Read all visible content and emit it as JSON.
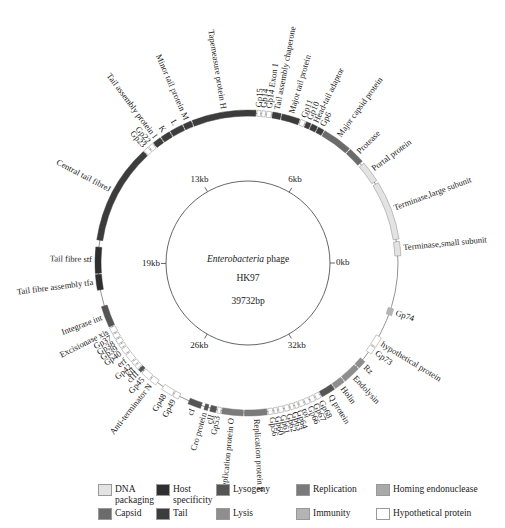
{
  "center": {
    "line1_italic": "Enterobacteria",
    "line1_rest": " phage",
    "line2": "HK97",
    "line3": "39732bp"
  },
  "genome_length_kb": 39.732,
  "ticks": [
    {
      "label": "0kb",
      "kb": 0
    },
    {
      "label": "6kb",
      "kb": 6.6
    },
    {
      "label": "13kb",
      "kb": 13.2
    },
    {
      "label": "19kb",
      "kb": 19.9
    },
    {
      "label": "26kb",
      "kb": 26.5
    },
    {
      "label": "32kb",
      "kb": 33.1
    }
  ],
  "categories": {
    "dna_packaging": {
      "label": "DNA packaging",
      "color": "#e3e3e3"
    },
    "host_specificity": {
      "label": "Host specificity",
      "color": "#2f2f2f"
    },
    "lysogeny": {
      "label": "Lysogeny",
      "color": "#555555"
    },
    "replication": {
      "label": "Replication",
      "color": "#7a7a7a"
    },
    "homing_endonuclease": {
      "label": "Homing endonuclease",
      "color": "#a9a9a9"
    },
    "capsid": {
      "label": "Capsid",
      "color": "#6b6b6b"
    },
    "tail": {
      "label": "Tail",
      "color": "#3c3c3c"
    },
    "lysis": {
      "label": "Lysis",
      "color": "#8e8e8e"
    },
    "immunity": {
      "label": "Immunity",
      "color": "#b4b4b4"
    },
    "hypothetical": {
      "label": "Hypothetical protein",
      "color": "#ffffff"
    }
  },
  "legend": [
    {
      "key": "dna_packaging",
      "label_lines": [
        "DNA",
        "packaging"
      ]
    },
    {
      "key": "host_specificity",
      "label_lines": [
        "Host",
        "specificity"
      ]
    },
    {
      "key": "lysogeny",
      "label_lines": [
        "Lysogeny"
      ]
    },
    {
      "key": "replication",
      "label_lines": [
        "Replication"
      ]
    },
    {
      "key": "homing_endonuclease",
      "label_lines": [
        "Homing endonuclease"
      ]
    },
    {
      "key": "capsid",
      "label_lines": [
        "Capsid"
      ]
    },
    {
      "key": "tail",
      "label_lines": [
        "Tail"
      ]
    },
    {
      "key": "lysis",
      "label_lines": [
        "Lysis"
      ]
    },
    {
      "key": "immunity",
      "label_lines": [
        "Immunity"
      ]
    },
    {
      "key": "hypothetical",
      "label_lines": [
        "Hypothetical protein"
      ]
    }
  ],
  "genes": [
    {
      "name": "Terminase,small subunit",
      "start": 0.3,
      "end": 0.9,
      "cat": "dna_packaging"
    },
    {
      "name": "Terminase,large subunit",
      "start": 1.0,
      "end": 3.5,
      "cat": "dna_packaging"
    },
    {
      "name": "Portal protein",
      "start": 3.6,
      "end": 4.5,
      "cat": "dna_packaging"
    },
    {
      "name": "Protease",
      "start": 4.6,
      "end": 5.3,
      "cat": "capsid"
    },
    {
      "name": "Major capsid protein",
      "start": 5.35,
      "end": 6.6,
      "cat": "capsid"
    },
    {
      "name": "Gp6",
      "start": 6.65,
      "end": 6.9,
      "cat": "tail"
    },
    {
      "name": "Head-tail adaptor",
      "start": 6.95,
      "end": 7.2,
      "cat": "tail"
    },
    {
      "name": "Gp10",
      "start": 7.25,
      "end": 7.45,
      "cat": "tail"
    },
    {
      "name": "Gp11",
      "start": 7.5,
      "end": 7.7,
      "cat": "hypothetical"
    },
    {
      "name": "Major tail protein",
      "start": 7.75,
      "end": 8.5,
      "cat": "tail"
    },
    {
      "name": "Tail assembly chaperone",
      "start": 8.55,
      "end": 8.9,
      "cat": "tail"
    },
    {
      "name": "Gp14 Exon 1",
      "start": 8.95,
      "end": 9.15,
      "cat": "hypothetical"
    },
    {
      "name": "Gp14",
      "start": 9.2,
      "end": 9.35,
      "cat": "hypothetical"
    },
    {
      "name": "Gp15",
      "start": 9.4,
      "end": 9.55,
      "cat": "hypothetical"
    },
    {
      "name": "Tapemeasure protein H",
      "start": 9.6,
      "end": 12.3,
      "cat": "tail"
    },
    {
      "name": "Minor tail protein M",
      "start": 12.35,
      "end": 12.7,
      "cat": "tail"
    },
    {
      "name": "L",
      "start": 12.75,
      "end": 13.3,
      "cat": "tail"
    },
    {
      "name": "K",
      "start": 13.35,
      "end": 13.75,
      "cat": "tail"
    },
    {
      "name": "Tail assembly protein I",
      "start": 13.8,
      "end": 14.15,
      "cat": "tail"
    },
    {
      "name": "Gp22",
      "start": 14.2,
      "end": 14.4,
      "cat": "hypothetical"
    },
    {
      "name": "Gp23",
      "start": 14.45,
      "end": 14.65,
      "cat": "hypothetical"
    },
    {
      "name": "Central tail fibreJ",
      "start": 14.7,
      "end": 18.9,
      "cat": "tail"
    },
    {
      "name": "Tail fibre stf",
      "start": 19.2,
      "end": 20.3,
      "cat": "host_specificity"
    },
    {
      "name": "Tail fibre assembly tfa",
      "start": 20.35,
      "end": 21.0,
      "cat": "host_specificity"
    },
    {
      "name": "Integrase int",
      "start": 21.7,
      "end": 22.6,
      "cat": "lysogeny"
    },
    {
      "name": "Excisionase xis",
      "start": 22.65,
      "end": 22.9,
      "cat": "hypothetical"
    },
    {
      "name": "Gp37",
      "start": 22.95,
      "end": 23.15,
      "cat": "hypothetical"
    },
    {
      "name": "Gp38",
      "start": 23.2,
      "end": 23.4,
      "cat": "hypothetical"
    },
    {
      "name": "Gp39",
      "start": 23.45,
      "end": 23.6,
      "cat": "hypothetical"
    },
    {
      "name": "Gp40",
      "start": 23.65,
      "end": 23.9,
      "cat": "hypothetical"
    },
    {
      "name": "erf",
      "start": 23.95,
      "end": 24.3,
      "cat": "hypothetical"
    },
    {
      "name": "Gp42",
      "start": 24.35,
      "end": 24.5,
      "cat": "hypothetical"
    },
    {
      "name": "kil",
      "start": 24.55,
      "end": 24.7,
      "cat": "hypothetical"
    },
    {
      "name": "cIII",
      "start": 24.75,
      "end": 24.9,
      "cat": "lysogeny"
    },
    {
      "name": "Gp45",
      "start": 24.95,
      "end": 25.35,
      "cat": "hypothetical"
    },
    {
      "name": "Anti-terminator N",
      "start": 25.4,
      "end": 25.7,
      "cat": "hypothetical"
    },
    {
      "name": "Gp48",
      "start": 26.0,
      "end": 26.5,
      "cat": "hypothetical"
    },
    {
      "name": "Gp49",
      "start": 26.55,
      "end": 26.8,
      "cat": "hypothetical"
    },
    {
      "name": "cI",
      "start": 27.25,
      "end": 27.8,
      "cat": "lysogeny"
    },
    {
      "name": "Cro protein",
      "start": 27.95,
      "end": 28.1,
      "cat": "lysogeny"
    },
    {
      "name": "cII",
      "start": 28.2,
      "end": 28.45,
      "cat": "lysogeny"
    },
    {
      "name": "Gp53",
      "start": 28.5,
      "end": 28.65,
      "cat": "hypothetical"
    },
    {
      "name": "Replication protein O",
      "start": 28.7,
      "end": 29.6,
      "cat": "replication"
    },
    {
      "name": "Replication protein P",
      "start": 29.65,
      "end": 30.6,
      "cat": "replication"
    },
    {
      "name": "Gp56",
      "start": 30.65,
      "end": 30.85,
      "cat": "hypothetical"
    },
    {
      "name": "Gp60",
      "start": 30.9,
      "end": 31.05,
      "cat": "hypothetical"
    },
    {
      "name": "Gp61",
      "start": 31.1,
      "end": 31.3,
      "cat": "hypothetical"
    },
    {
      "name": "Gp62",
      "start": 31.35,
      "end": 31.55,
      "cat": "hypothetical"
    },
    {
      "name": "Gp63",
      "start": 31.6,
      "end": 31.75,
      "cat": "hypothetical"
    },
    {
      "name": "Gp64",
      "start": 31.8,
      "end": 31.95,
      "cat": "hypothetical"
    },
    {
      "name": "roi",
      "start": 32.0,
      "end": 32.2,
      "cat": "hypothetical"
    },
    {
      "name": "Gp66",
      "start": 32.25,
      "end": 32.45,
      "cat": "hypothetical"
    },
    {
      "name": "Gp67",
      "start": 32.5,
      "end": 32.7,
      "cat": "hypothetical"
    },
    {
      "name": "Gp68",
      "start": 32.75,
      "end": 32.95,
      "cat": "hypothetical"
    },
    {
      "name": "Q protein",
      "start": 33.0,
      "end": 33.6,
      "cat": "lysogeny"
    },
    {
      "name": "Holin",
      "start": 33.65,
      "end": 34.1,
      "cat": "lysis"
    },
    {
      "name": "Endolysin",
      "start": 34.15,
      "end": 34.9,
      "cat": "lysis"
    },
    {
      "name": "Rz",
      "start": 34.95,
      "end": 35.3,
      "cat": "lysis"
    },
    {
      "name": "Gp73",
      "start": 35.7,
      "end": 36.0,
      "cat": "hypothetical"
    },
    {
      "name": "hypothetical protein",
      "start": 36.05,
      "end": 36.5,
      "cat": "hypothetical"
    },
    {
      "name": "Gp74",
      "start": 37.5,
      "end": 37.8,
      "cat": "immunity"
    }
  ]
}
